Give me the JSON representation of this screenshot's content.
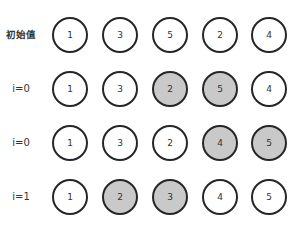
{
  "diagram": {
    "colors": {
      "border": "#262626",
      "highlight_fill": "#c9c9c9",
      "normal_fill": "#ffffff"
    },
    "rows": [
      {
        "label": "初始值",
        "bold": true,
        "nodes": [
          {
            "value": "1",
            "hl": false
          },
          {
            "value": "3",
            "hl": false
          },
          {
            "value": "5",
            "hl": false
          },
          {
            "value": "2",
            "hl": false
          },
          {
            "value": "4",
            "hl": false
          }
        ]
      },
      {
        "label": "i=0",
        "bold": false,
        "nodes": [
          {
            "value": "1",
            "hl": false
          },
          {
            "value": "3",
            "hl": false
          },
          {
            "value": "2",
            "hl": true
          },
          {
            "value": "5",
            "hl": true
          },
          {
            "value": "4",
            "hl": false
          }
        ]
      },
      {
        "label": "i=0",
        "bold": false,
        "nodes": [
          {
            "value": "1",
            "hl": false
          },
          {
            "value": "3",
            "hl": false
          },
          {
            "value": "2",
            "hl": false
          },
          {
            "value": "4",
            "hl": true
          },
          {
            "value": "5",
            "hl": true
          }
        ]
      },
      {
        "label": "i=1",
        "bold": false,
        "nodes": [
          {
            "value": "1",
            "hl": false
          },
          {
            "value": "2",
            "hl": true
          },
          {
            "value": "3",
            "hl": true
          },
          {
            "value": "4",
            "hl": false
          },
          {
            "value": "5",
            "hl": false
          }
        ]
      }
    ]
  }
}
